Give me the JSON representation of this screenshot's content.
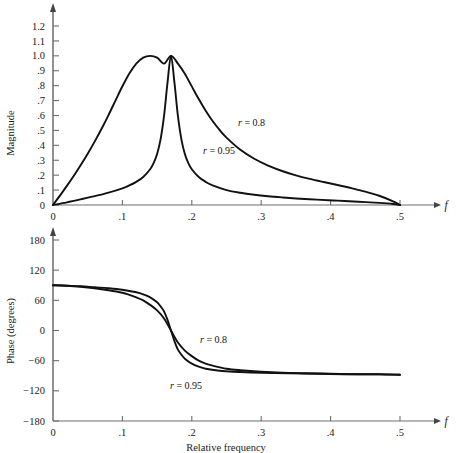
{
  "figure": {
    "background": "#ffffff",
    "curve_color": "#111111",
    "axis_color": "#6e6e6e"
  },
  "chart_data": [
    {
      "type": "line",
      "id": "magnitude-plot",
      "title": "",
      "xlabel": "f",
      "ylabel": "Magnitude",
      "xlim": [
        0,
        0.5
      ],
      "ylim": [
        0,
        1.2
      ],
      "grid": false,
      "legend_position": "inline-annotation",
      "xticks": [
        0,
        0.1,
        0.2,
        0.3,
        0.4,
        0.5
      ],
      "xticklabels": [
        "0",
        ".1",
        ".2",
        ".3",
        ".4",
        ".5"
      ],
      "yticks": [
        0,
        0.1,
        0.2,
        0.3,
        0.4,
        0.5,
        0.6,
        0.7,
        0.8,
        0.9,
        1.0,
        1.1,
        1.2
      ],
      "yticklabels": [
        "0",
        ".1",
        ".2",
        ".3",
        ".4",
        ".5",
        ".6",
        ".7",
        ".8",
        ".9",
        "1.0",
        "1.1",
        "1.2"
      ],
      "series": [
        {
          "name": "r = 0.8",
          "label": "r = 0.8",
          "r": 0.8,
          "f0": 0.17,
          "x": [
            0,
            0.01,
            0.02,
            0.03,
            0.04,
            0.05,
            0.06,
            0.07,
            0.08,
            0.09,
            0.1,
            0.11,
            0.12,
            0.13,
            0.14,
            0.15,
            0.16,
            0.17,
            0.18,
            0.19,
            0.2,
            0.21,
            0.22,
            0.23,
            0.24,
            0.25,
            0.27,
            0.29,
            0.31,
            0.33,
            0.35,
            0.37,
            0.39,
            0.41,
            0.43,
            0.45,
            0.47,
            0.49,
            0.5
          ],
          "y": [
            0.0,
            0.063,
            0.128,
            0.196,
            0.268,
            0.344,
            0.425,
            0.511,
            0.603,
            0.7,
            0.796,
            0.882,
            0.948,
            0.988,
            1.0,
            0.988,
            0.948,
            1.0,
            0.948,
            0.88,
            0.795,
            0.71,
            0.632,
            0.563,
            0.503,
            0.452,
            0.37,
            0.31,
            0.264,
            0.228,
            0.199,
            0.175,
            0.154,
            0.134,
            0.113,
            0.09,
            0.062,
            0.025,
            0.0
          ]
        },
        {
          "name": "r = 0.95",
          "label": "r = 0.95",
          "r": 0.95,
          "f0": 0.17,
          "x": [
            0,
            0.02,
            0.04,
            0.06,
            0.08,
            0.1,
            0.11,
            0.12,
            0.13,
            0.14,
            0.145,
            0.15,
            0.155,
            0.16,
            0.165,
            0.17,
            0.175,
            0.18,
            0.185,
            0.19,
            0.195,
            0.2,
            0.21,
            0.22,
            0.23,
            0.25,
            0.27,
            0.29,
            0.31,
            0.33,
            0.35,
            0.38,
            0.41,
            0.44,
            0.47,
            0.49,
            0.5
          ],
          "y": [
            0.0,
            0.018,
            0.038,
            0.059,
            0.083,
            0.112,
            0.131,
            0.155,
            0.188,
            0.24,
            0.281,
            0.342,
            0.44,
            0.597,
            0.82,
            1.0,
            0.82,
            0.597,
            0.44,
            0.342,
            0.281,
            0.24,
            0.188,
            0.155,
            0.131,
            0.1,
            0.082,
            0.069,
            0.059,
            0.051,
            0.044,
            0.036,
            0.029,
            0.022,
            0.014,
            0.007,
            0.0
          ]
        }
      ]
    },
    {
      "type": "line",
      "id": "phase-plot",
      "title": "",
      "xlabel": "Relative frequency",
      "xaxis_symbol": "f",
      "ylabel": "Phase (degrees)",
      "xlim": [
        0,
        0.5
      ],
      "ylim": [
        -180,
        180
      ],
      "grid": false,
      "legend_position": "inline-annotation",
      "xticks": [
        0,
        0.1,
        0.2,
        0.3,
        0.4,
        0.5
      ],
      "xticklabels": [
        "0",
        ".1",
        ".2",
        ".3",
        ".4",
        ".5"
      ],
      "yticks": [
        180,
        120,
        60,
        0,
        -60,
        -120,
        -180
      ],
      "yticklabels": [
        "180",
        "120",
        "60",
        "0",
        "−60",
        "−120",
        "−180"
      ],
      "series": [
        {
          "name": "r = 0.8",
          "label": "r = 0.8",
          "r": 0.8,
          "f0": 0.17,
          "x": [
            0,
            0.02,
            0.04,
            0.06,
            0.08,
            0.1,
            0.11,
            0.12,
            0.13,
            0.14,
            0.15,
            0.16,
            0.17,
            0.18,
            0.19,
            0.2,
            0.21,
            0.22,
            0.23,
            0.25,
            0.27,
            0.3,
            0.33,
            0.36,
            0.4,
            0.44,
            0.47,
            0.5
          ],
          "y": [
            90,
            89,
            87,
            84,
            80,
            75,
            71,
            66,
            60,
            51,
            40,
            24,
            0,
            -24,
            -40,
            -51,
            -60,
            -66,
            -70,
            -76,
            -79,
            -82,
            -84,
            -85,
            -86,
            -87,
            -87,
            -88
          ]
        },
        {
          "name": "r = 0.95",
          "label": "r = 0.95",
          "r": 0.95,
          "f0": 0.17,
          "x": [
            0,
            0.02,
            0.04,
            0.06,
            0.08,
            0.1,
            0.12,
            0.13,
            0.14,
            0.15,
            0.155,
            0.16,
            0.165,
            0.17,
            0.175,
            0.18,
            0.185,
            0.19,
            0.2,
            0.21,
            0.22,
            0.24,
            0.26,
            0.3,
            0.34,
            0.38,
            0.42,
            0.46,
            0.5
          ],
          "y": [
            90,
            89,
            88,
            86,
            84,
            81,
            76,
            72,
            66,
            56,
            48,
            38,
            21,
            0,
            -21,
            -38,
            -48,
            -56,
            -66,
            -72,
            -76,
            -80,
            -82,
            -84,
            -85,
            -86,
            -87,
            -87,
            -88
          ]
        }
      ]
    }
  ],
  "magnitude": {
    "ylabel": "Magnitude",
    "xaxis_symbol": "f",
    "yticklabels": [
      "1.2",
      "1.1",
      "1.0",
      ".9",
      ".8",
      ".7",
      ".6",
      ".5",
      ".4",
      ".3",
      ".2",
      ".1",
      "0"
    ],
    "xticklabels": [
      "0",
      ".1",
      ".2",
      ".3",
      ".4",
      ".5"
    ],
    "annotation_r08": "r = 0.8",
    "annotation_r095": "r = 0.95"
  },
  "phase": {
    "ylabel": "Phase (degrees)",
    "xlabel": "Relative frequency",
    "xaxis_symbol": "f",
    "yticklabels": [
      "180",
      "120",
      "60",
      "0",
      "−60",
      "−120",
      "−180"
    ],
    "xticklabels": [
      "0",
      ".1",
      ".2",
      ".3",
      ".4",
      ".5"
    ],
    "annotation_r08": "r = 0.8",
    "annotation_r095": "r = 0.95"
  }
}
